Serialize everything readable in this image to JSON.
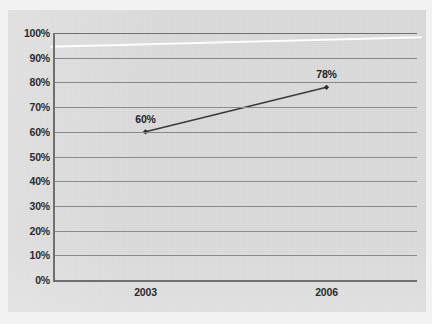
{
  "chart_data": {
    "type": "line",
    "title": "",
    "xlabel": "",
    "ylabel": "",
    "categories": [
      "2003",
      "2006"
    ],
    "series": [
      {
        "name": "",
        "values": [
          60,
          78
        ],
        "point_labels": [
          "60%",
          "78%"
        ]
      }
    ],
    "ylim": [
      0,
      100
    ],
    "ytick_values": [
      0,
      10,
      20,
      30,
      40,
      50,
      60,
      70,
      80,
      90,
      100
    ],
    "ytick_labels": [
      "0%",
      "10%",
      "20%",
      "30%",
      "40%",
      "50%",
      "60%",
      "70%",
      "80%",
      "90%",
      "100%"
    ],
    "xtick_labels": [
      "2003",
      "2006"
    ],
    "grid": "horizontal",
    "legend": "none",
    "colors": {
      "series_line": "#3a3a3a",
      "marker": "#2b2b2b",
      "gridline": "#8a8a8a",
      "axis": "#6f6f6f",
      "plot_background": "#dcdcdc",
      "page_background": "#f2f2f2",
      "label_text": "#2b2b2b"
    }
  }
}
